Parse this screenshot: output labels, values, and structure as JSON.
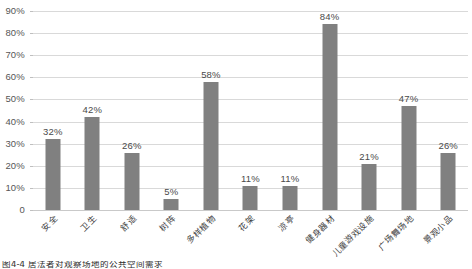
{
  "chart_data": {
    "type": "bar",
    "title": "",
    "xlabel": "",
    "ylabel": "",
    "ylim": [
      0,
      90
    ],
    "grid": true,
    "legend": "none",
    "orientation": "vertical",
    "bar_color": "#808080",
    "gridline_color": "#d9d9d9",
    "label_rotation": -45,
    "categories": [
      "安全",
      "卫生",
      "舒适",
      "树阵",
      "多样植物",
      "花架",
      "凉亭",
      "健身器材",
      "儿童游戏设施",
      "广场舞场地",
      "景观小品"
    ],
    "values": [
      32,
      42,
      26,
      5,
      58,
      11,
      11,
      84,
      21,
      47,
      26
    ],
    "value_labels": [
      "32%",
      "42%",
      "26%",
      "5%",
      "58%",
      "11%",
      "11%",
      "84%",
      "21%",
      "47%",
      "26%"
    ],
    "y_ticks": [
      0,
      10,
      20,
      30,
      40,
      50,
      60,
      70,
      80,
      90
    ],
    "y_tick_labels": [
      "0",
      "10%",
      "20%",
      "30%",
      "40%",
      "50%",
      "60%",
      "70%",
      "80%",
      "90%"
    ]
  },
  "caption": {
    "figure_number": "图4-4",
    "text": "图4-4   居法者对观察场地的公共空间需求"
  }
}
